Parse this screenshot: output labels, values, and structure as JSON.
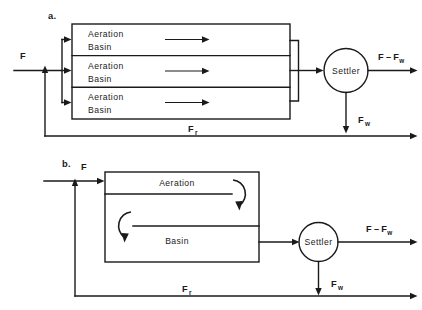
{
  "figure": {
    "panels": [
      {
        "id": "a",
        "label": "a.",
        "units": [
          {
            "name": "Aeration",
            "name2": "Basin"
          },
          {
            "name": "Aeration",
            "name2": "Basin"
          },
          {
            "name": "Aeration",
            "name2": "Basin"
          }
        ],
        "settler_label": "Settler",
        "streams": {
          "feed": "F",
          "effluent_main": "F",
          "effluent_minus": "–",
          "effluent_sub": "F",
          "effluent_sub_w": "w",
          "waste": "F",
          "waste_sub": "w",
          "recycle": "F",
          "recycle_sub": "r"
        }
      },
      {
        "id": "b",
        "label": "b.",
        "unit_line1": "Aeration",
        "unit_line2": "Basin",
        "settler_label": "Settler",
        "streams": {
          "feed": "F",
          "effluent_main": "F",
          "effluent_minus": "–",
          "effluent_sub": "F",
          "effluent_sub_w": "w",
          "waste": "F",
          "waste_sub": "w",
          "recycle": "F",
          "recycle_sub": "r"
        }
      }
    ],
    "caption_fragment": "",
    "colors": {
      "ink": "#1a1a1a",
      "background": "#ffffff"
    }
  }
}
